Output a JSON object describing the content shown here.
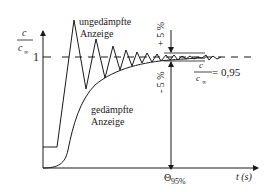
{
  "diagram": {
    "y_axis_label": {
      "numerator": "c",
      "denominator": "c",
      "denominator_sub": "∞"
    },
    "y_tick_label": "1",
    "x_axis_label": "t (s)",
    "x_marker_label": {
      "symbol": "Θ",
      "sub": "95%"
    },
    "undamped_label": [
      "ungedämpfte",
      "Anzeige"
    ],
    "damped_label": [
      "gedämpfte",
      "Anzeige"
    ],
    "upper_tolerance": "+ 5 %",
    "lower_tolerance": "- 5 %",
    "ratio_label": {
      "numerator": "c",
      "denominator": "c",
      "denominator_sub": "∞",
      "value": "= 0,95"
    }
  },
  "colors": {
    "line": "#1a1a1a",
    "background": "#ffffff"
  }
}
